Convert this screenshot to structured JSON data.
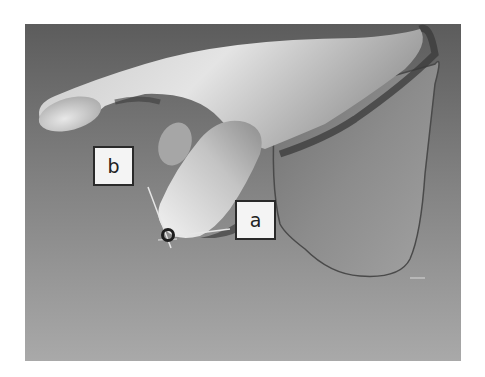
{
  "figure": {
    "background_top": "#5c5c5c",
    "background_bottom": "#a9a9a9",
    "bone_color": "#b8b8b8",
    "labels": [
      {
        "id": "b",
        "text": "b"
      },
      {
        "id": "a",
        "text": "a"
      }
    ],
    "marker": {
      "type": "ring",
      "color": "#1e1e1e"
    },
    "axis_lines_color": "#e6e6e6"
  }
}
